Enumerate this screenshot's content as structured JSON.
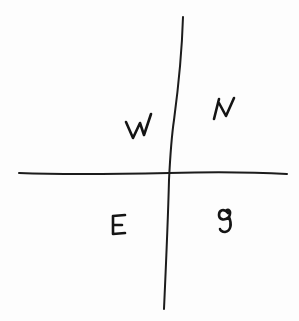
{
  "diagram": {
    "type": "hand-drawn quadrant cross",
    "axes": {
      "vertical": {
        "from": [
          183,
          17
        ],
        "mid": [
          170,
          155
        ],
        "to": [
          164,
          309
        ]
      },
      "horizontal": {
        "from": [
          19,
          173
        ],
        "to": [
          287,
          174
        ]
      }
    },
    "quadrant_labels": {
      "top_left": "W",
      "top_right": "IV",
      "bottom_left": "E",
      "bottom_right": "g"
    },
    "colors": {
      "ink": "#141414",
      "paper": "#fdfdfd"
    }
  }
}
